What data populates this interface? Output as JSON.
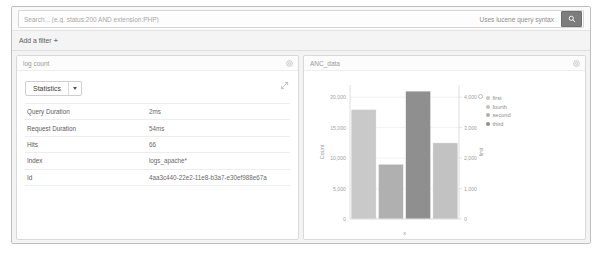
{
  "querybar": {
    "search_placeholder": "Search... (e.g. status:200 AND extension:PHP)",
    "search_value": "",
    "lucene_hint": "Uses lucene query syntax",
    "search_icon": "search-icon"
  },
  "filterbar": {
    "add_filter_label": "Add a filter",
    "plus_glyph": "+"
  },
  "left_panel": {
    "title": "log count",
    "gear_icon": "gear-icon",
    "expand_icon": "expand-icon",
    "select": {
      "value": "Statistics",
      "caret_icon": "chevron-down-icon"
    },
    "rows": [
      {
        "key": "Query Duration",
        "value": "2ms"
      },
      {
        "key": "Request Duration",
        "value": "54ms"
      },
      {
        "key": "Hits",
        "value": "66"
      },
      {
        "key": "Index",
        "value": "logs_apache*"
      },
      {
        "key": "Id",
        "value": "4aa3c440-22e2-11e8-b3a7-e30ef988e67a"
      }
    ]
  },
  "right_panel": {
    "title": "ANC_data",
    "gear_icon": "gear-icon"
  },
  "chart_data": {
    "type": "bar",
    "title": "ANC_data",
    "categories": [
      "first",
      "second",
      "third",
      "fourth"
    ],
    "values": [
      18000,
      9000,
      21000,
      12500
    ],
    "colors": [
      "#c9c9c9",
      "#b0b0b0",
      "#8f8f8f",
      "#c2c2c2"
    ],
    "xlabel": "x",
    "ylabel": "Count",
    "y2label": "first",
    "ylim": [
      0,
      22000
    ],
    "yticks": [
      0,
      5000,
      10000,
      15000,
      20000
    ],
    "ytick_labels": [
      "0",
      "5,000",
      "10,000",
      "15,000",
      "20,000"
    ],
    "y2lim": [
      0,
      4400
    ],
    "y2ticks": [
      0,
      1000,
      2000,
      3000,
      4000
    ],
    "y2tick_labels": [
      "0",
      "1,000",
      "2,000",
      "3,000",
      "4,000"
    ],
    "grid": true,
    "legend_position": "right",
    "legend": [
      {
        "label": "first",
        "color": "#c9c9c9"
      },
      {
        "label": "fourth",
        "color": "#c2c2c2"
      },
      {
        "label": "second",
        "color": "#b0b0b0"
      },
      {
        "label": "third",
        "color": "#8f8f8f"
      }
    ]
  }
}
